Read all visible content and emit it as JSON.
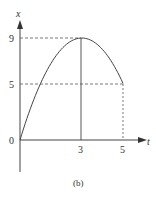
{
  "chart_data": {
    "type": "line",
    "title": "",
    "caption": "(b)",
    "xlabel": "t",
    "ylabel": "x",
    "xlim": [
      0,
      5.9
    ],
    "ylim": [
      -2.8,
      11
    ],
    "grid": false,
    "legend": null,
    "x_ticks": [
      {
        "value": 3,
        "label": "3"
      },
      {
        "value": 5,
        "label": "5"
      }
    ],
    "y_ticks": [
      {
        "value": 0,
        "label": "0"
      },
      {
        "value": 5,
        "label": "5"
      },
      {
        "value": 9,
        "label": "9"
      }
    ],
    "function": "x = 6t - t^2",
    "series": [
      {
        "name": "x(t)",
        "x": [
          0,
          0.5,
          1,
          1.5,
          2,
          2.5,
          3,
          3.5,
          4,
          4.5,
          5
        ],
        "values": [
          0,
          2.75,
          5,
          6.75,
          8,
          8.75,
          9,
          8.75,
          8,
          6.75,
          5
        ]
      }
    ],
    "annotations": [
      {
        "type": "dashed-hline",
        "y": 9,
        "from_x": 0,
        "to_x": 3
      },
      {
        "type": "dashed-hline",
        "y": 5,
        "from_x": 0,
        "to_x": 5
      },
      {
        "type": "solid-vline",
        "x": 3,
        "from_y": 0,
        "to_y": 9
      },
      {
        "type": "dashed-vline",
        "x": 5,
        "from_y": 0,
        "to_y": 5
      }
    ]
  },
  "labels": {
    "x_axis": "t",
    "y_axis": "x",
    "origin": "0",
    "tick_t3": "3",
    "tick_t5": "5",
    "tick_x5": "5",
    "tick_x9": "9",
    "caption": "(b)"
  },
  "colors": {
    "line": "#444444",
    "text": "#333333",
    "background": "#ffffff"
  }
}
